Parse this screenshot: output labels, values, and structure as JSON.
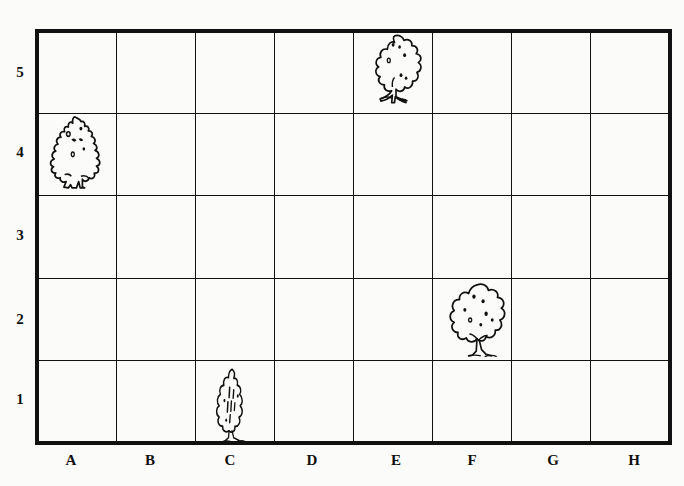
{
  "figure": {
    "kind": "grid-map",
    "background_color": "#fbfbf9",
    "ink_color": "#111111"
  },
  "grid": {
    "columns": 8,
    "rows": 5,
    "left_px": 37,
    "right_px": 670,
    "top_px": 31,
    "bottom_px": 443,
    "border_width_px": 4,
    "line_width_px": 1,
    "column_labels": [
      "A",
      "B",
      "C",
      "D",
      "E",
      "F",
      "G",
      "H"
    ],
    "row_labels": [
      "1",
      "2",
      "3",
      "4",
      "5"
    ],
    "column_label_y_px": 461,
    "row_label_x_px": 20,
    "column_centers_px": [
      71,
      150,
      230,
      312,
      396,
      472,
      553,
      634
    ],
    "row_centers_px": [
      400,
      320,
      236,
      153,
      73
    ]
  },
  "chart_data": {
    "type": "table",
    "title": "",
    "xlabel": "",
    "ylabel": "",
    "categories": [
      "A",
      "B",
      "C",
      "D",
      "E",
      "F",
      "G",
      "H"
    ],
    "rows": [
      "1",
      "2",
      "3",
      "4",
      "5"
    ],
    "occupied_cells": [
      {
        "column": "E",
        "row": "5",
        "content": "tree",
        "shape": "deciduous-tree"
      },
      {
        "column": "A",
        "row": "4",
        "content": "tree",
        "shape": "conifer-tree"
      },
      {
        "column": "F",
        "row": "2",
        "content": "tree",
        "shape": "broadleaf-tree"
      },
      {
        "column": "C",
        "row": "1",
        "content": "bush",
        "shape": "columnar-shrub"
      }
    ],
    "empty_cells_note": "All other squares are empty"
  },
  "items": [
    {
      "id": "tree-e5",
      "label": "tree",
      "cell": "E5",
      "column": "E",
      "row": "5",
      "icon": "deciduous-tree-icon",
      "left_px": 360,
      "top_px": 33,
      "width_px": 72,
      "height_px": 74
    },
    {
      "id": "tree-a4",
      "label": "tree",
      "cell": "A4",
      "column": "A",
      "row": "4",
      "icon": "conifer-tree-icon",
      "left_px": 38,
      "top_px": 113,
      "width_px": 74,
      "height_px": 78
    },
    {
      "id": "tree-f2",
      "label": "tree",
      "cell": "F2",
      "column": "F",
      "row": "2",
      "icon": "broadleaf-tree-icon",
      "left_px": 439,
      "top_px": 281,
      "width_px": 76,
      "height_px": 78
    },
    {
      "id": "bush-c1",
      "label": "bush",
      "cell": "C1",
      "column": "C",
      "row": "1",
      "icon": "columnar-shrub-icon",
      "left_px": 203,
      "top_px": 367,
      "width_px": 58,
      "height_px": 76
    }
  ],
  "labels": {
    "columns": [
      {
        "text": "A",
        "x": 71
      },
      {
        "text": "B",
        "x": 150
      },
      {
        "text": "C",
        "x": 230
      },
      {
        "text": "D",
        "x": 312
      },
      {
        "text": "E",
        "x": 396
      },
      {
        "text": "F",
        "x": 472
      },
      {
        "text": "G",
        "x": 553
      },
      {
        "text": "H",
        "x": 634
      }
    ],
    "rows": [
      {
        "text": "5",
        "y": 73
      },
      {
        "text": "4",
        "y": 153
      },
      {
        "text": "3",
        "y": 236
      },
      {
        "text": "2",
        "y": 320
      },
      {
        "text": "1",
        "y": 400
      }
    ]
  }
}
